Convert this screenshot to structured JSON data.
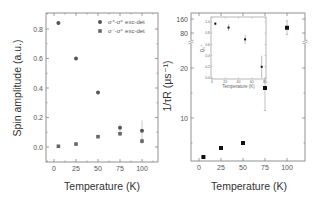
{
  "chart_data": [
    {
      "type": "scatter",
      "title": "",
      "xlabel": "Temperature (K)",
      "ylabel": "Spin amplitude (a.u.)",
      "xlim": [
        -10,
        115
      ],
      "ylim": [
        -0.1,
        0.9
      ],
      "x_ticks": [
        "0",
        "25",
        "50",
        "75",
        "100"
      ],
      "y_ticks": [
        "0.0",
        "0.2",
        "0.4",
        "0.6",
        "0.8"
      ],
      "grid": false,
      "legend_position": "upper right",
      "series": [
        {
          "name": "σ⁺-σ⁺ exc-det",
          "marker": "circle",
          "x": [
            5,
            25,
            50,
            75,
            100
          ],
          "y": [
            0.84,
            0.6,
            0.37,
            0.13,
            0.11
          ],
          "yerr": [
            0.01,
            0.01,
            0.01,
            0.02,
            0.07
          ]
        },
        {
          "name": "σ⁻-σ⁺ exc-det",
          "marker": "square",
          "x": [
            5,
            25,
            50,
            75,
            100
          ],
          "y": [
            0.005,
            0.02,
            0.07,
            0.09,
            0.04
          ],
          "yerr": [
            0.005,
            0.005,
            0.01,
            0.015,
            0.02
          ]
        }
      ]
    },
    {
      "type": "scatter",
      "title": "",
      "xlabel": "Temperature (K)",
      "ylabel": "1/τR (μs⁻¹)",
      "xlim": [
        -10,
        120
      ],
      "ylim_lower": [
        1,
        25
      ],
      "ylim_upper": [
        60,
        170
      ],
      "axis_break": true,
      "x_ticks": [
        "0",
        "25",
        "50",
        "75",
        "100"
      ],
      "y_ticks": [
        "10",
        "20",
        "80",
        "160"
      ],
      "grid": false,
      "series": [
        {
          "name": "1/τR",
          "marker": "square",
          "x": [
            5,
            25,
            50,
            75,
            100
          ],
          "y": [
            2.2,
            4.0,
            5.0,
            16.0,
            110
          ],
          "yerr": [
            0.1,
            0.2,
            0.2,
            4.5,
            40
          ]
        }
      ],
      "inset": {
        "type": "scatter",
        "xlabel": "Temperature (K)",
        "ylabel": "Q₀⁺",
        "xlim": [
          0,
          80
        ],
        "ylim": [
          0.0,
          1.1
        ],
        "x_ticks": [
          "0",
          "20",
          "40",
          "60",
          "80"
        ],
        "y_ticks": [
          "0.0",
          "0.2",
          "0.4",
          "0.6",
          "0.8",
          "1.0"
        ],
        "series": [
          {
            "name": "Q",
            "marker": "square",
            "x": [
              5,
              25,
              50,
              75
            ],
            "y": [
              0.97,
              0.9,
              0.69,
              0.2
            ],
            "yerr": [
              0.03,
              0.06,
              0.08,
              0.2
            ]
          }
        ]
      }
    }
  ]
}
